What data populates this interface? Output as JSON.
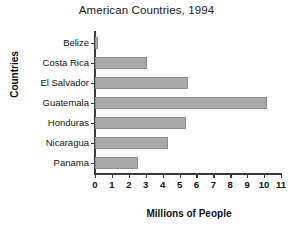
{
  "chart_data": {
    "type": "bar",
    "orientation": "horizontal",
    "title": "American Countries, 1994",
    "xlabel": "Millions of People",
    "ylabel": "Countries",
    "categories": [
      "Belize",
      "Costa Rica",
      "El Salvador",
      "Guatemala",
      "Honduras",
      "Nicaragua",
      "Panama"
    ],
    "values": [
      0.2,
      3.1,
      5.5,
      10.2,
      5.4,
      4.3,
      2.55
    ],
    "xticks": [
      "0",
      "1",
      "2",
      "3",
      "4",
      "5",
      "6",
      "7",
      "8",
      "9",
      "10",
      "11"
    ],
    "xlim": [
      0,
      11
    ],
    "grid": false,
    "legend": "none",
    "bar_color": "#a9a9a9",
    "axis_color": "#3b3b3b",
    "background": "#ffffff"
  }
}
